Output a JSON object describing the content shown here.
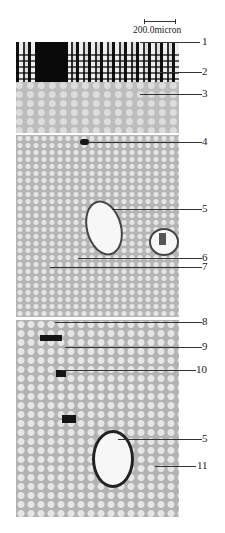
{
  "figure": {
    "scale_bar": {
      "label": "200.0micron"
    },
    "panels": [
      {
        "id": "top",
        "description": "periderm and cortex"
      },
      {
        "id": "middle",
        "description": "cortex with vessels"
      },
      {
        "id": "bottom",
        "description": "cortex with cell clusters and vessel"
      }
    ],
    "labels": [
      {
        "text": "1",
        "y": 42
      },
      {
        "text": "2",
        "y": 72
      },
      {
        "text": "3",
        "y": 94
      },
      {
        "text": "4",
        "y": 142
      },
      {
        "text": "5",
        "y": 209
      },
      {
        "text": "6",
        "y": 258
      },
      {
        "text": "7",
        "y": 267
      },
      {
        "text": "8",
        "y": 322
      },
      {
        "text": "9",
        "y": 347
      },
      {
        "text": "10",
        "y": 370
      },
      {
        "text": "5",
        "y": 439
      },
      {
        "text": "11",
        "y": 466
      }
    ]
  }
}
